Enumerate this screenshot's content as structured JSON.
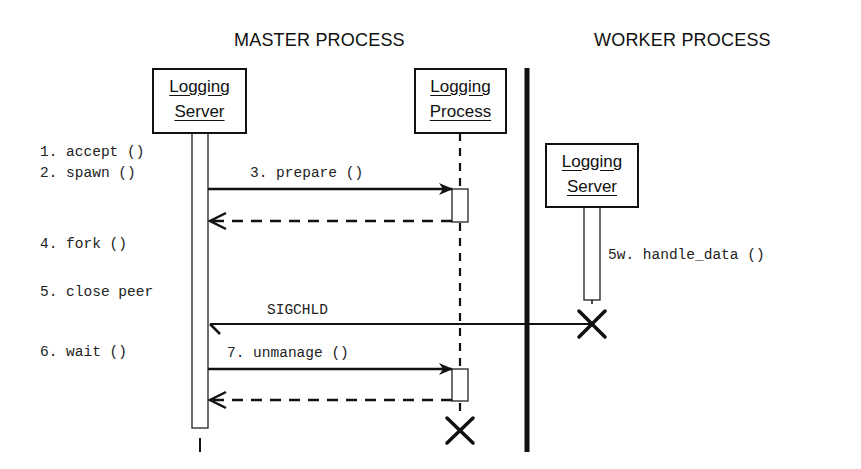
{
  "diagram": {
    "type": "sequence",
    "swimlanes": [
      {
        "id": "master",
        "label": "MASTER PROCESS"
      },
      {
        "id": "worker",
        "label": "WORKER PROCESS"
      }
    ],
    "participants": {
      "master_server": {
        "line1": "Logging",
        "line2": "Server"
      },
      "logging_process": {
        "line1": "Logging",
        "line2": "Process"
      },
      "worker_server": {
        "line1": "Logging",
        "line2": "Server"
      }
    },
    "steps": {
      "s1": "1. accept ()",
      "s2": "2. spawn ()",
      "s4": "4. fork ()",
      "s5": "5. close peer",
      "s6": "6. wait ()",
      "s5w": "5w. handle_data ()"
    },
    "messages": {
      "prepare": "3. prepare ()",
      "sigchld": "SIGCHLD",
      "unmanage": "7. unmanage ()"
    }
  }
}
